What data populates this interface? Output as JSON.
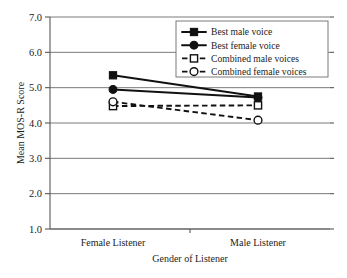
{
  "chart_data": {
    "type": "line",
    "title": "",
    "xlabel": "Gender of Listener",
    "ylabel": "Mean MOS-R Score",
    "categories": [
      "Female Listener",
      "Male Listener"
    ],
    "ylim": [
      1.0,
      7.0
    ],
    "ytick_step": 1.0,
    "ytick_labels": [
      "7.0",
      "6.0",
      "5.0",
      "4.0",
      "3.0",
      "2.0",
      "1.0"
    ],
    "ytick_values": [
      7.0,
      6.0,
      5.0,
      4.0,
      3.0,
      2.0,
      1.0
    ],
    "grid": "horizontal",
    "legend_position": "top-right",
    "series": [
      {
        "name": "Best male voice",
        "marker": "filled-square",
        "linestyle": "solid",
        "color": "#111111",
        "values": [
          5.35,
          4.75
        ]
      },
      {
        "name": "Best female voice",
        "marker": "filled-circle",
        "linestyle": "solid",
        "color": "#111111",
        "values": [
          4.95,
          4.72
        ]
      },
      {
        "name": "Combined male voices",
        "marker": "open-square",
        "linestyle": "dashed",
        "color": "#111111",
        "values": [
          4.48,
          4.5
        ]
      },
      {
        "name": "Combined female voices",
        "marker": "open-circle",
        "linestyle": "dashed",
        "color": "#111111",
        "values": [
          4.6,
          4.08
        ]
      }
    ]
  }
}
